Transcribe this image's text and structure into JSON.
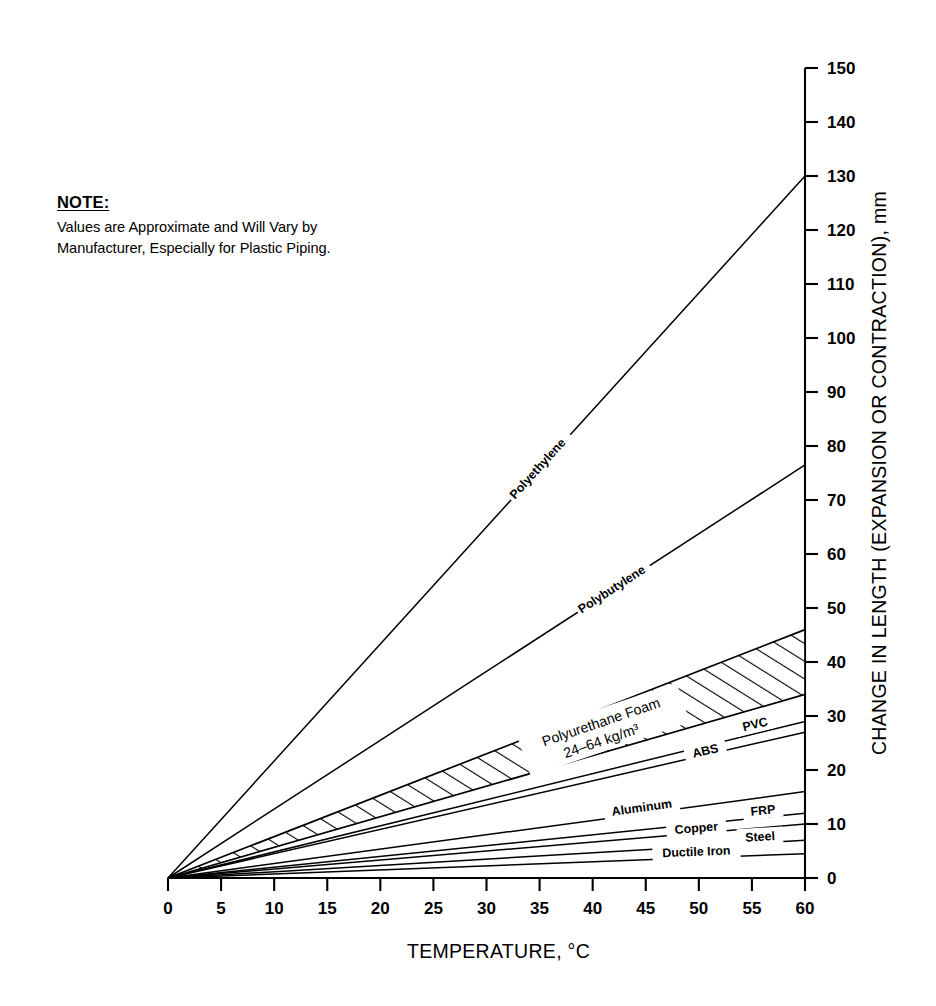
{
  "note": {
    "title": "NOTE:",
    "line1": "Values are Approximate and Will Vary by",
    "line2": "Manufacturer, Especially for Plastic Piping."
  },
  "chart_data": {
    "type": "line",
    "title": "",
    "xlabel": "TEMPERATURE, °C",
    "ylabel": "CHANGE IN LENGTH (EXPANSION OR CONTRACTION), mm",
    "xlim": [
      0,
      60
    ],
    "ylim": [
      0,
      150
    ],
    "xticks": [
      0,
      5,
      10,
      15,
      20,
      25,
      30,
      35,
      40,
      45,
      50,
      55,
      60
    ],
    "yticks": [
      0,
      10,
      20,
      30,
      40,
      50,
      60,
      70,
      80,
      90,
      100,
      110,
      120,
      130,
      140,
      150
    ],
    "xtick_labels": [
      "0",
      "5",
      "10",
      "15",
      "20",
      "25",
      "30",
      "35",
      "40",
      "45",
      "50",
      "55",
      "60"
    ],
    "ytick_labels": [
      "0",
      "10",
      "20",
      "30",
      "40",
      "50",
      "60",
      "70",
      "80",
      "90",
      "100",
      "110",
      "120",
      "130",
      "140",
      "150"
    ],
    "grid": false,
    "legend_position": "inline-labels",
    "axis_position": "y-axis-right",
    "x": [
      0,
      60
    ],
    "series": [
      {
        "name": "Polyethylene",
        "values": [
          0,
          130.0
        ],
        "label": "Polyethylene"
      },
      {
        "name": "Polybutylene",
        "values": [
          0,
          76.5
        ],
        "label": "Polybutylene"
      },
      {
        "name": "Polyurethane Foam upper",
        "values": [
          0,
          46.0
        ],
        "label": ""
      },
      {
        "name": "Polyurethane Foam lower",
        "values": [
          0,
          34.0
        ],
        "label": ""
      },
      {
        "name": "PVC",
        "values": [
          0,
          29.0
        ],
        "label": "PVC"
      },
      {
        "name": "ABS",
        "values": [
          0,
          27.0
        ],
        "label": "ABS"
      },
      {
        "name": "Aluminum",
        "values": [
          0,
          16.0
        ],
        "label": "Aluminum"
      },
      {
        "name": "FRP",
        "values": [
          0,
          12.0
        ],
        "label": "FRP"
      },
      {
        "name": "Copper",
        "values": [
          0,
          10.0
        ],
        "label": "Copper"
      },
      {
        "name": "Steel",
        "values": [
          0,
          7.0
        ],
        "label": "Steel"
      },
      {
        "name": "Ductile Iron",
        "values": [
          0,
          4.5
        ],
        "label": "Ductile Iron"
      }
    ],
    "band": {
      "name": "Polyurethane Foam",
      "label_line1": "Polyurethane Foam",
      "label_line2": "24–64 kg/m³",
      "upper_at_60": 46.0,
      "lower_at_60": 34.0,
      "fill": "hatched"
    },
    "annotations": [
      "Values are Approximate and Will Vary by Manufacturer, Especially for Plastic Piping."
    ]
  },
  "colors": {
    "ink": "#000000",
    "background": "#ffffff"
  }
}
